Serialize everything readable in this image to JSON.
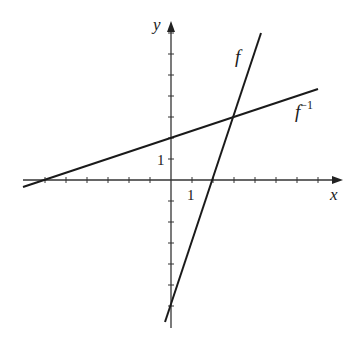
{
  "chart_data": {
    "type": "line",
    "title": "",
    "xlabel": "x",
    "ylabel": "y",
    "xlim": [
      -7,
      8
    ],
    "ylim": [
      -7,
      7.5
    ],
    "grid": false,
    "tick_spacing": 1,
    "tick_labels": {
      "x": [
        "1"
      ],
      "y": [
        "1"
      ]
    },
    "series": [
      {
        "name": "f",
        "label": "f",
        "equation": "y = 3x - 6",
        "x": [
          -0.29,
          4.29
        ],
        "y": [
          -6.86,
          6.86
        ]
      },
      {
        "name": "f_inverse",
        "label": "f",
        "label_sup": "−1",
        "equation": "y = x/3 + 2",
        "x": [
          -7.05,
          7.0
        ],
        "y": [
          -0.35,
          4.33
        ]
      }
    ],
    "annotations": [
      {
        "text": "intersection",
        "x": 3,
        "y": 3
      }
    ]
  },
  "axes": {
    "x_label": "x",
    "y_label": "y",
    "x_tick_label": "1",
    "y_tick_label": "1"
  },
  "labels": {
    "f": "f",
    "f_inv_base": "f",
    "f_inv_sup": "−1"
  },
  "colors": {
    "line": "#1a1a1a",
    "axis": "#333333"
  },
  "layout": {
    "origin_px": [
      171,
      180
    ],
    "unit_px": 21
  }
}
